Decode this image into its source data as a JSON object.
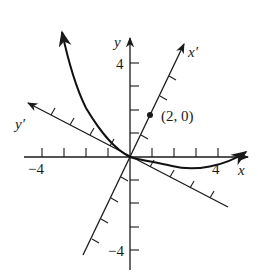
{
  "figure": {
    "type": "rotated-axes-parabola",
    "axes": {
      "x_label": "x",
      "y_label": "y",
      "x_prime_label": "x′",
      "y_prime_label": "y′",
      "x_ticks": [
        "−4",
        "4"
      ],
      "y_ticks": [
        "4",
        "−4"
      ]
    },
    "point": {
      "label": "(2, 0)"
    },
    "colors": {
      "ink": "#1a1a1a",
      "background": "#ffffff"
    }
  }
}
